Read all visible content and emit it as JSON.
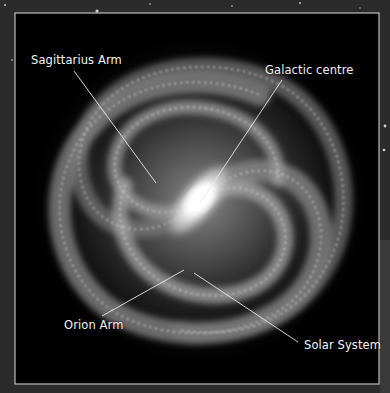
{
  "image": {
    "subject": "Milky Way galaxy (top-down illustration)",
    "style": "grayscale",
    "frame_border_color": "#bdbdbd",
    "background_color": "#000000",
    "outer_texture_color": "#2a2a2a"
  },
  "labels": [
    {
      "id": "sagittarius-arm",
      "text": "Sagittarius Arm",
      "x": 31,
      "y": 53,
      "line": {
        "x1": 74,
        "y1": 71,
        "x2": 156,
        "y2": 183
      }
    },
    {
      "id": "galactic-centre",
      "text": "Galactic centre",
      "x": 265,
      "y": 63,
      "line": {
        "x1": 282,
        "y1": 80,
        "x2": 200,
        "y2": 203
      }
    },
    {
      "id": "orion-arm",
      "text": "Orion Arm",
      "x": 64,
      "y": 318,
      "line": {
        "x1": 102,
        "y1": 316,
        "x2": 184,
        "y2": 270
      }
    },
    {
      "id": "solar-system",
      "text": "Solar System",
      "x": 304,
      "y": 338,
      "line": {
        "x1": 298,
        "y1": 342,
        "x2": 194,
        "y2": 273
      }
    }
  ]
}
